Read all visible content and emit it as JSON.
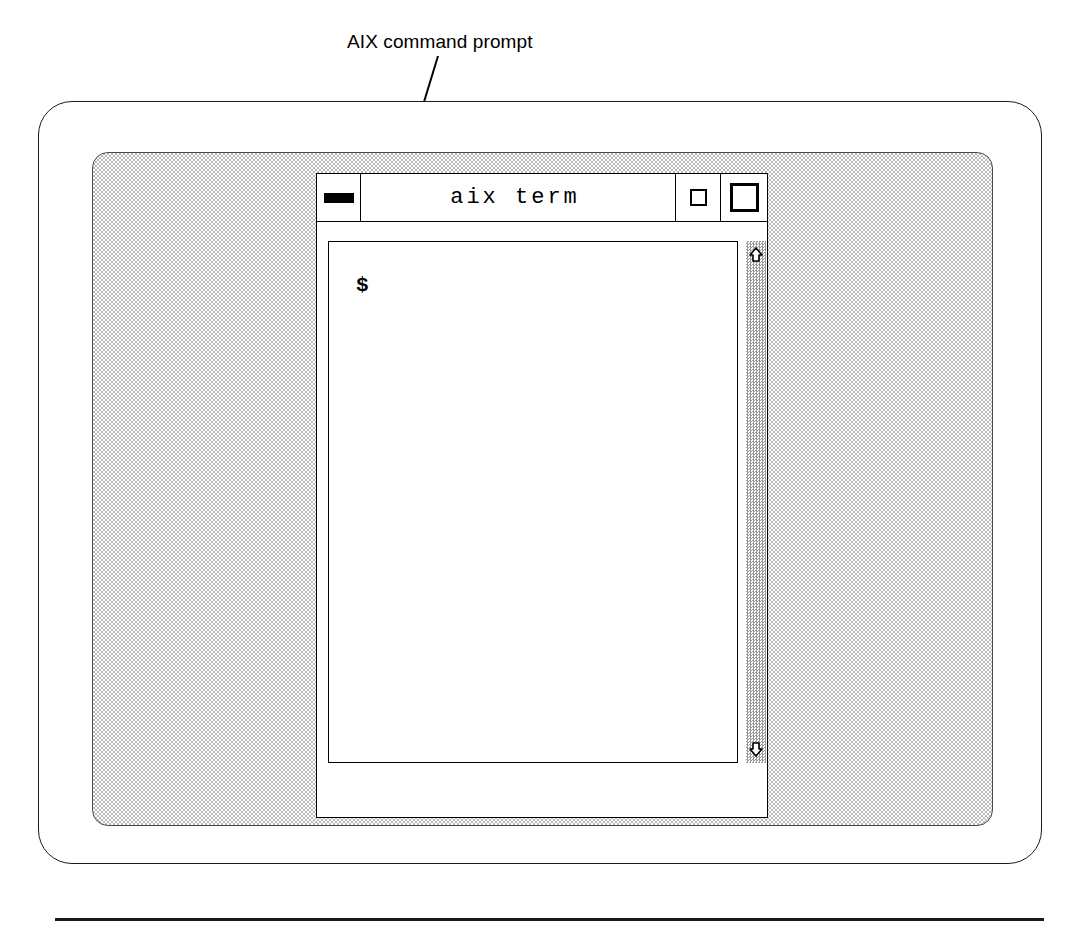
{
  "figure": {
    "callout": {
      "label": "AIX command prompt",
      "leader_icon": "arrow-pointer-icon"
    },
    "bottom_rule": "horizontal-rule"
  },
  "monitor": {
    "bezel_name": "monitor-bezel",
    "screen_name": "monitor-screen",
    "screen_fill": "#b9b9b9",
    "bezel_fill": "#ffffff",
    "border_color": "#000000"
  },
  "terminal_window": {
    "title": "aix term",
    "titlebar": {
      "minimize": {
        "icon": "minimize-bar-icon",
        "label": ""
      },
      "restore": {
        "icon": "restore-square-icon",
        "label": ""
      },
      "maximize": {
        "icon": "maximize-square-icon",
        "label": ""
      }
    },
    "text_area": {
      "prompt": "$",
      "content": ""
    },
    "scrollbar": {
      "up_arrow_icon": "scroll-up-arrow-icon",
      "down_arrow_icon": "scroll-down-arrow-icon",
      "track_fill": "#9a9a9a"
    }
  }
}
